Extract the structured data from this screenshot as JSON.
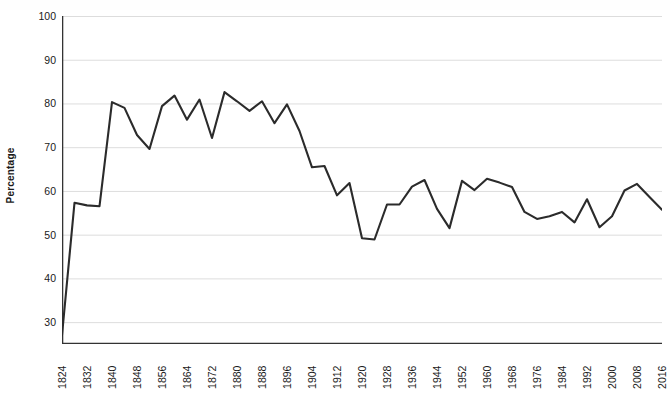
{
  "chart_data": {
    "type": "line",
    "title": "",
    "subtitle": "",
    "xlabel": "",
    "ylabel": "Percentage",
    "ylim": [
      25,
      100
    ],
    "xlim": [
      1824,
      2016
    ],
    "grid": "horizontal",
    "legend": "none",
    "y_ticks": [
      30,
      40,
      50,
      60,
      70,
      80,
      90,
      100
    ],
    "x_ticks": [
      1824,
      1832,
      1840,
      1848,
      1856,
      1864,
      1872,
      1880,
      1888,
      1896,
      1904,
      1912,
      1920,
      1928,
      1936,
      1944,
      1952,
      1960,
      1968,
      1976,
      1984,
      1992,
      2000,
      2008,
      2016
    ],
    "line_color": "#2b2b2b",
    "gridline_color": "#dddddd",
    "axis_color": "#333333",
    "series": [
      {
        "name": "Percentage",
        "x": [
          1824,
          1828,
          1832,
          1836,
          1840,
          1844,
          1848,
          1852,
          1856,
          1860,
          1864,
          1868,
          1872,
          1876,
          1880,
          1884,
          1888,
          1892,
          1896,
          1900,
          1904,
          1908,
          1912,
          1916,
          1920,
          1924,
          1928,
          1932,
          1936,
          1940,
          1944,
          1948,
          1952,
          1956,
          1960,
          1964,
          1968,
          1972,
          1976,
          1980,
          1984,
          1988,
          1992,
          1996,
          2000,
          2004,
          2008,
          2012,
          2016
        ],
        "values": [
          27.0,
          57.3,
          56.7,
          56.5,
          80.3,
          79.0,
          72.8,
          69.6,
          79.4,
          81.8,
          76.3,
          80.9,
          72.1,
          82.6,
          80.5,
          78.3,
          80.5,
          75.5,
          79.8,
          73.7,
          65.4,
          65.7,
          59.0,
          61.8,
          49.2,
          48.9,
          56.9,
          56.9,
          61.0,
          62.5,
          55.9,
          51.5,
          62.3,
          60.2,
          62.8,
          61.9,
          60.9,
          55.2,
          53.6,
          54.2,
          55.2,
          52.8,
          58.1,
          51.7,
          54.2,
          60.1,
          61.6,
          58.6,
          55.7
        ]
      }
    ]
  }
}
